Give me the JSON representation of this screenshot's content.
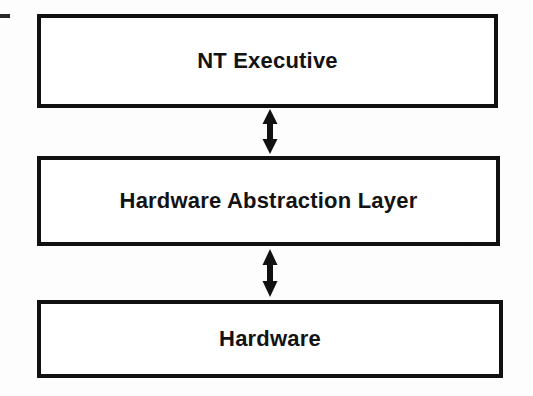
{
  "diagram": {
    "type": "layered-block-diagram",
    "background_color": "#fdfdfd",
    "line_color": "#111111",
    "text_color": "#131313",
    "layers": [
      {
        "id": "nt-executive",
        "label": "NT Executive",
        "order": 1
      },
      {
        "id": "hardware-abstraction-layer",
        "label": "Hardware Abstraction Layer",
        "order": 2
      },
      {
        "id": "hardware",
        "label": "Hardware",
        "order": 3
      }
    ],
    "connectors": [
      {
        "id": "arrow-exec-hal",
        "icon": "double-arrow-vertical-icon",
        "from": "NT Executive",
        "to": "Hardware Abstraction Layer",
        "direction": "bidirectional"
      },
      {
        "id": "arrow-hal-hardware",
        "icon": "double-arrow-vertical-icon",
        "from": "Hardware Abstraction Layer",
        "to": "Hardware",
        "direction": "bidirectional"
      }
    ],
    "artifacts": [
      {
        "id": "edge-scan-mark",
        "description": "scan-edge-dash"
      }
    ]
  }
}
